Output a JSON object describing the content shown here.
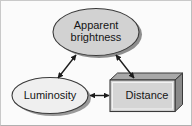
{
  "figure": {
    "background_color": "#fbfbfb",
    "frame_color": "#c9c9c9"
  },
  "nodes": [
    {
      "id": "apparent-brightness",
      "label": "Apparent\nbrightness",
      "shape": "ellipse",
      "fill": "#d2d2d2",
      "stroke": "#3a3a3a",
      "shadow": "#8e8e8e"
    },
    {
      "id": "luminosity",
      "label": "Luminosity",
      "shape": "ellipse",
      "fill": "#efefef",
      "stroke": "#3a3a3a",
      "shadow": "#9a9a9a"
    },
    {
      "id": "distance",
      "label": "Distance",
      "shape": "box-3d",
      "fill": "#d5d5d5",
      "stroke": "#3a3a3a",
      "shadow": "#8a8a8a"
    }
  ],
  "connectors": [
    {
      "id": "brightness-luminosity",
      "from": "apparent-brightness",
      "to": "luminosity",
      "style": "double-headed-arrow",
      "color": "#1c1c1c"
    },
    {
      "id": "brightness-distance",
      "from": "apparent-brightness",
      "to": "distance",
      "style": "double-headed-arrow",
      "color": "#1c1c1c"
    },
    {
      "id": "luminosity-distance",
      "from": "luminosity",
      "to": "distance",
      "style": "double-headed-arrow",
      "color": "#1c1c1c"
    }
  ]
}
